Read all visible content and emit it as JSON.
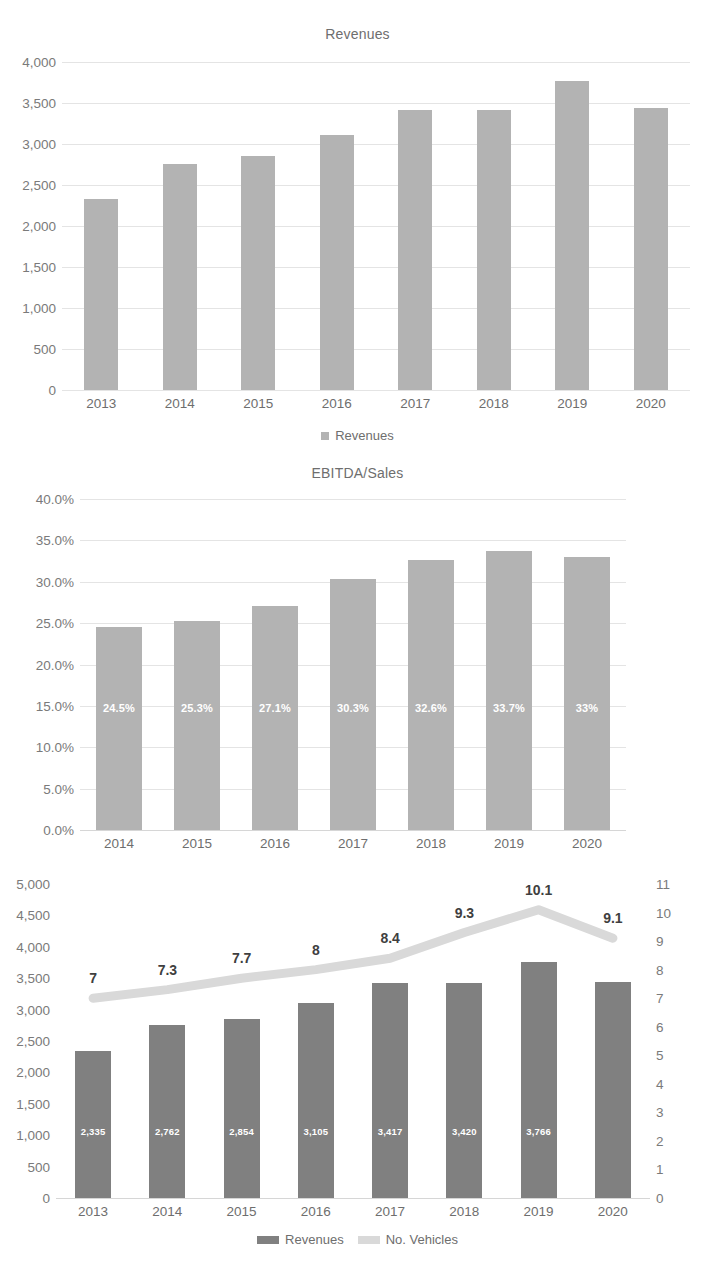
{
  "page": {
    "width": 715,
    "height": 1275,
    "background": "#ffffff"
  },
  "colors": {
    "bar_light": "#b3b3b3",
    "bar_dark": "#808080",
    "line_light": "#d9d9d9",
    "gridline": "#e4e4e4",
    "axis_text": "#7a7a7a",
    "title_text": "#6e6e6e",
    "label_white": "#ffffff",
    "point_label": "#3f3f3f"
  },
  "charts": [
    {
      "id": "revenues-chart",
      "title": "Revenues",
      "legend": [
        {
          "label": "Revenues",
          "color": "#b3b3b3",
          "marker": "square"
        }
      ]
    },
    {
      "id": "ebitda-sales-chart",
      "title": "EBITDA/Sales",
      "legend": []
    },
    {
      "id": "revenues-vehicles-chart",
      "title": "",
      "legend": [
        {
          "label": "Revenues",
          "color": "#808080",
          "marker": "bar"
        },
        {
          "label": "No. Vehicles",
          "color": "#d9d9d9",
          "marker": "bar"
        }
      ]
    }
  ],
  "chart_data": [
    {
      "type": "bar",
      "id": "revenues-chart",
      "title": "Revenues",
      "xlabel": "",
      "ylabel": "",
      "categories": [
        "2013",
        "2014",
        "2015",
        "2016",
        "2017",
        "2018",
        "2019",
        "2020"
      ],
      "series": [
        {
          "name": "Revenues",
          "color": "#b3b3b3",
          "values": [
            2335,
            2762,
            2854,
            3105,
            3417,
            3420,
            3766,
            3440
          ]
        }
      ],
      "ylim": [
        0,
        4000
      ],
      "yticks": [
        0,
        500,
        1000,
        1500,
        2000,
        2500,
        3000,
        3500,
        4000
      ],
      "ytick_labels": [
        "0",
        "500",
        "1,000",
        "1,500",
        "2,000",
        "2,500",
        "3,000",
        "3,500",
        "4,000"
      ],
      "grid": true,
      "legend_position": "bottom",
      "legend_entries": [
        "Revenues"
      ]
    },
    {
      "type": "bar",
      "id": "ebitda-sales-chart",
      "title": "EBITDA/Sales",
      "xlabel": "",
      "ylabel": "",
      "categories": [
        "2014",
        "2015",
        "2016",
        "2017",
        "2018",
        "2019",
        "2020"
      ],
      "series": [
        {
          "name": "EBITDA/Sales",
          "color": "#b3b3b3",
          "values": [
            24.5,
            25.3,
            27.1,
            30.3,
            32.6,
            33.7,
            33.0
          ]
        }
      ],
      "data_labels": [
        "24.5%",
        "25.3%",
        "27.1%",
        "30.3%",
        "32.6%",
        "33.7%",
        "33%"
      ],
      "ylim": [
        0,
        40
      ],
      "yticks": [
        0,
        5,
        10,
        15,
        20,
        25,
        30,
        35,
        40
      ],
      "ytick_labels": [
        "0.0%",
        "5.0%",
        "10.0%",
        "15.0%",
        "20.0%",
        "25.0%",
        "30.0%",
        "35.0%",
        "40.0%"
      ],
      "grid": true,
      "legend_position": "none",
      "legend_entries": []
    },
    {
      "type": "bar+line",
      "id": "revenues-vehicles-chart",
      "title": "",
      "xlabel": "",
      "ylabel": "",
      "categories": [
        "2013",
        "2014",
        "2015",
        "2016",
        "2017",
        "2018",
        "2019",
        "2020"
      ],
      "series": [
        {
          "name": "Revenues",
          "type": "bar",
          "axis": "left",
          "color": "#808080",
          "values": [
            2335,
            2762,
            2854,
            3105,
            3417,
            3420,
            3766,
            3440
          ],
          "data_labels": [
            "2,335",
            "2,762",
            "2,854",
            "3,105",
            "3,417",
            "3,420",
            "3,766",
            ""
          ]
        },
        {
          "name": "No. Vehicles",
          "type": "line",
          "axis": "right",
          "color": "#d9d9d9",
          "values": [
            7,
            7.3,
            7.7,
            8,
            8.4,
            9.3,
            10.1,
            9.1
          ],
          "data_labels": [
            "7",
            "7.3",
            "7.7",
            "8",
            "8.4",
            "9.3",
            "10.1",
            "9.1"
          ]
        }
      ],
      "ylim": [
        0,
        5000
      ],
      "yticks": [
        0,
        500,
        1000,
        1500,
        2000,
        2500,
        3000,
        3500,
        4000,
        4500,
        5000
      ],
      "ytick_labels": [
        "0",
        "500",
        "1,000",
        "1,500",
        "2,000",
        "2,500",
        "3,000",
        "3,500",
        "4,000",
        "4,500",
        "5,000"
      ],
      "y2lim": [
        0,
        11
      ],
      "y2ticks": [
        0,
        1,
        2,
        3,
        4,
        5,
        6,
        7,
        8,
        9,
        10,
        11
      ],
      "y2tick_labels": [
        "0",
        "1",
        "2",
        "3",
        "4",
        "5",
        "6",
        "7",
        "8",
        "9",
        "10",
        "11"
      ],
      "grid": false,
      "legend_position": "bottom",
      "legend_entries": [
        "Revenues",
        "No. Vehicles"
      ]
    }
  ]
}
